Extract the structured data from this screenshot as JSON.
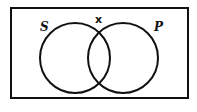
{
  "diagram": {
    "type": "venn",
    "sets": [
      {
        "label": "S",
        "position": "left"
      },
      {
        "label": "P",
        "position": "right"
      }
    ],
    "marks": [
      {
        "symbol": "x",
        "location": "on boundary at top of overlap region"
      }
    ],
    "colors": {
      "stroke": "#111111",
      "background": "#ffffff"
    }
  }
}
